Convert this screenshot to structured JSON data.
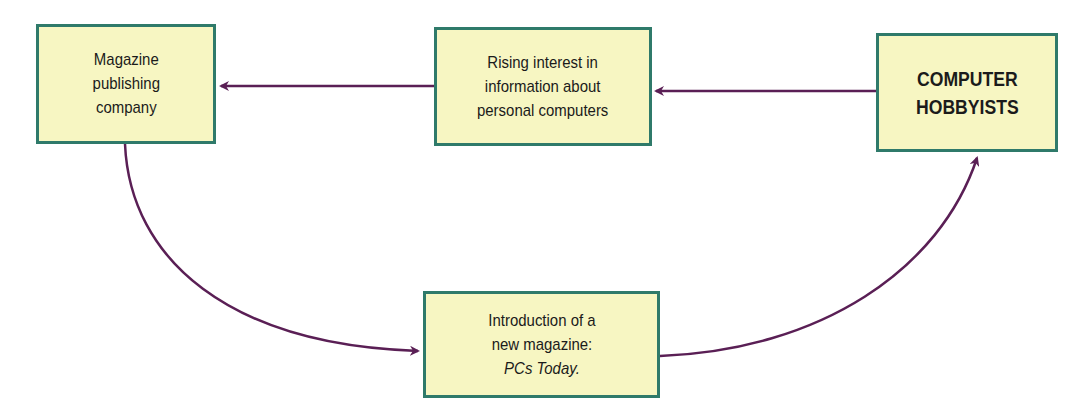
{
  "diagram": {
    "type": "flow-cycle",
    "colors": {
      "box_fill": "#f7f6c2",
      "box_border": "#2f7a6a",
      "arrow": "#5a1f55",
      "text": "#1b1b1b"
    },
    "nodes": [
      {
        "id": "publisher",
        "lines": [
          "Magazine",
          "publishing",
          "company"
        ]
      },
      {
        "id": "interest",
        "lines": [
          "Rising interest in",
          "information about",
          "personal computers"
        ]
      },
      {
        "id": "hobbyists",
        "lines": [
          "COMPUTER",
          "HOBBYISTS"
        ]
      },
      {
        "id": "new-magazine",
        "lines": [
          "Introduction of a",
          "new magazine:",
          "PCs Today."
        ]
      }
    ],
    "edges": [
      {
        "from": "hobbyists",
        "to": "interest"
      },
      {
        "from": "interest",
        "to": "publisher"
      },
      {
        "from": "publisher",
        "to": "new-magazine"
      },
      {
        "from": "new-magazine",
        "to": "hobbyists"
      }
    ]
  }
}
